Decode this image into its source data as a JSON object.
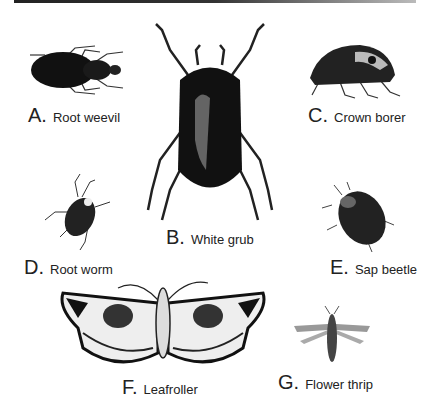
{
  "figure": {
    "items": [
      {
        "letter": "A.",
        "name": "Root weevil"
      },
      {
        "letter": "B.",
        "name": "White grub"
      },
      {
        "letter": "C.",
        "name": "Crown borer"
      },
      {
        "letter": "D.",
        "name": "Root worm"
      },
      {
        "letter": "E.",
        "name": "Sap beetle"
      },
      {
        "letter": "F.",
        "name": "Leafroller"
      },
      {
        "letter": "G.",
        "name": "Flower thrip"
      }
    ]
  }
}
